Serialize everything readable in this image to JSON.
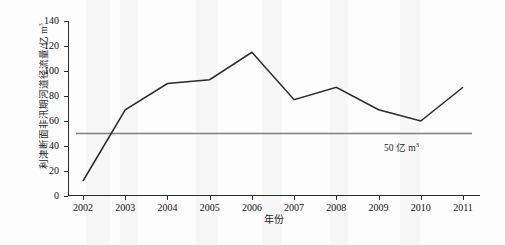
{
  "chart_data": {
    "type": "line",
    "title": "",
    "xlabel": "年份",
    "ylabel": "利津断面非汛期河道径流量/亿 m",
    "ylabel_sup": "3",
    "categories": [
      "2002",
      "2003",
      "2004",
      "2005",
      "2006",
      "2007",
      "2008",
      "2009",
      "2010",
      "2011"
    ],
    "series": [
      {
        "name": "利津断面非汛期河道径流量",
        "values": [
          12,
          69,
          90,
          93,
          115,
          77,
          87,
          69,
          60,
          87
        ],
        "color": "#2a2a2a"
      }
    ],
    "ylim": [
      0,
      140
    ],
    "yticks": [
      0,
      20,
      40,
      60,
      80,
      100,
      120,
      140
    ],
    "grid": false,
    "legend": "none",
    "annotations": [
      {
        "type": "hline",
        "value": 50,
        "label_text": "50 亿 m",
        "label_sup": "3",
        "color": "#808080"
      }
    ]
  }
}
